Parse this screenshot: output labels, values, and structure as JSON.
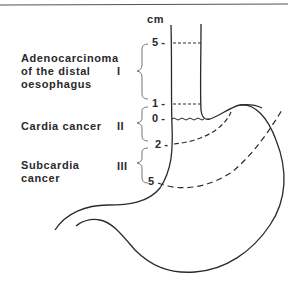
{
  "diagram": {
    "unit_label": "cm",
    "scale_marks": [
      {
        "value": "5 -",
        "y": 43
      },
      {
        "value": "1 -",
        "y": 104
      },
      {
        "value": "0 -",
        "y": 119
      },
      {
        "value": "2 -",
        "y": 145
      },
      {
        "value": "5",
        "y": 182
      }
    ],
    "categories": [
      {
        "roman": "I",
        "label_lines": [
          "Adenocarcinoma",
          "of the distal",
          "oesophagus"
        ]
      },
      {
        "roman": "II",
        "label_lines": [
          "Cardia cancer"
        ]
      },
      {
        "roman": "III",
        "label_lines": [
          "Subcardia",
          "cancer"
        ]
      }
    ],
    "colors": {
      "line": "#2a2a2a",
      "brace": "#777777",
      "border": "#555555",
      "background": "#ffffff"
    }
  }
}
